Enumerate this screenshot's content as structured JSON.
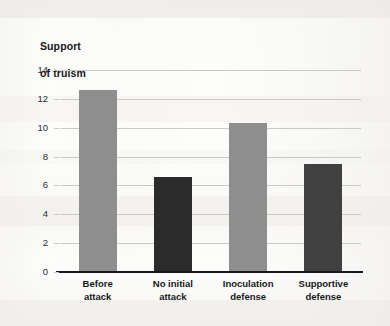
{
  "chart_data": {
    "type": "bar",
    "title": "Support\nof truism",
    "title_line1": "Support",
    "title_line2": "of truism",
    "xlabel": "",
    "ylabel": "Support of truism",
    "categories": [
      "Before attack",
      "No initial attack",
      "Inoculation defense",
      "Supportive defense"
    ],
    "category_lines": [
      [
        "Before",
        "attack"
      ],
      [
        "No initial",
        "attack"
      ],
      [
        "Inoculation",
        "defense"
      ],
      [
        "Supportive",
        "defense"
      ]
    ],
    "values": [
      12.6,
      6.6,
      10.3,
      7.5
    ],
    "bar_colors": [
      "#8e8e8e",
      "#2b2b2b",
      "#8e8e8e",
      "#404040"
    ],
    "ylim": [
      0,
      14
    ],
    "yticks": [
      0,
      2,
      4,
      6,
      8,
      10,
      12,
      14
    ],
    "ytick_labels": [
      "0",
      "2",
      "4",
      "6",
      "8",
      "10",
      "12",
      "14"
    ],
    "grid": true,
    "grid_color": "#c9c9c7",
    "axis_color": "#16181a",
    "legend": null,
    "legend_position": "none",
    "background_color": "#fbfbfa"
  }
}
